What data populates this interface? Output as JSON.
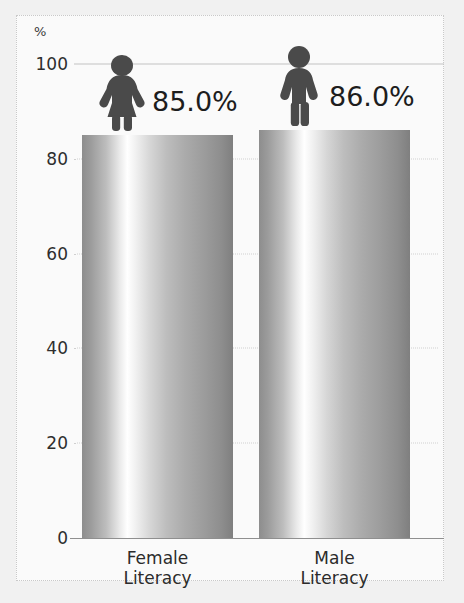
{
  "chart_data": {
    "type": "bar",
    "title": "",
    "subtitle": "",
    "xlabel": "",
    "ylabel": "%",
    "ylim": [
      0,
      100
    ],
    "yticks": [
      0,
      20,
      40,
      60,
      80,
      100
    ],
    "grid": true,
    "legend": false,
    "categories": [
      "Female\nLiteracy",
      "Male\nLiteracy"
    ],
    "values": [
      85.0,
      86.0
    ],
    "data_labels": [
      "85.0%",
      "86.0%"
    ],
    "icons": [
      "female-pictogram",
      "male-pictogram"
    ],
    "series": [
      {
        "name": "Literacy rate",
        "values": [
          85.0,
          86.0
        ]
      }
    ]
  },
  "axis": {
    "unit_label": "%",
    "ticks": [
      {
        "label": "100",
        "value": 100
      },
      {
        "label": "80",
        "value": 80
      },
      {
        "label": "60",
        "value": 60
      },
      {
        "label": "40",
        "value": 40
      },
      {
        "label": "20",
        "value": 20
      },
      {
        "label": "0",
        "value": 0
      }
    ]
  },
  "bars": [
    {
      "category": "Female Literacy",
      "label_line1": "Female",
      "label_line2": "Literacy",
      "value": 85.0,
      "value_label": "85.0%",
      "icon": "female-pictogram"
    },
    {
      "category": "Male Literacy",
      "label_line1": "Male",
      "label_line2": "Literacy",
      "value": 86.0,
      "value_label": "86.0%",
      "icon": "male-pictogram"
    }
  ],
  "colors": {
    "background": "#f1f1f1",
    "panel": "#fafafa",
    "frame_border": "#c9c9c9",
    "text": "#1d1d1d",
    "tick_text": "#2e2e2e",
    "gridline": "#cfcfcf",
    "baseline": "#8f8f8f",
    "pictogram": "#4a4a4a",
    "bar_light": "#ffffff",
    "bar_dark": "#7f7f7f"
  }
}
